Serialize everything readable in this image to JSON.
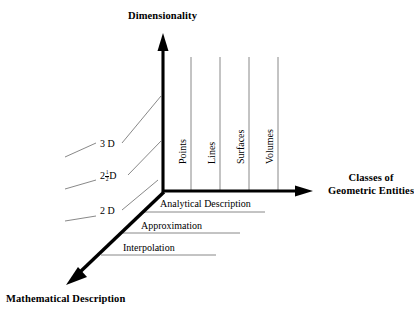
{
  "figure": {
    "kind": "3d-axis-concept-diagram",
    "background_color": "#ffffff",
    "ink_color": "#000000",
    "grid_color": "#7b7b7b"
  },
  "axes": {
    "vertical": {
      "title": "Dimensionality",
      "arrow": "up-arrow-icon"
    },
    "horizontal": {
      "title_line1": "Classes of",
      "title_line2": "Geometric Entities",
      "arrow": "right-arrow-icon"
    },
    "diagonal": {
      "title": "Mathematical Description",
      "arrow": "down-left-arrow-icon"
    }
  },
  "entity_classes": [
    {
      "label": "Points"
    },
    {
      "label": "Lines"
    },
    {
      "label": "Surfaces"
    },
    {
      "label": "Volumes"
    }
  ],
  "dimensionality_levels": [
    {
      "label": "3 D",
      "whole": "3",
      "fraction": null,
      "unit": "D"
    },
    {
      "label": "2½D",
      "whole": "2",
      "fraction": {
        "numerator": "1",
        "denominator": "2"
      },
      "unit": "D"
    },
    {
      "label": "2 D",
      "whole": "2",
      "fraction": null,
      "unit": "D"
    }
  ],
  "math_descriptions": [
    {
      "label": "Analytical Description"
    },
    {
      "label": "Approximation"
    },
    {
      "label": "Interpolation"
    }
  ]
}
